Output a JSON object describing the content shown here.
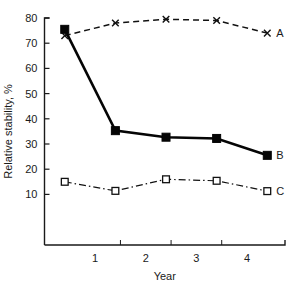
{
  "chart_data": {
    "type": "line",
    "title": "",
    "xlabel": "Year",
    "ylabel": "Relative stability, %",
    "xlim": [
      0,
      4.75
    ],
    "ylim": [
      5,
      81
    ],
    "grid": false,
    "legend_position": "right-inline",
    "x_ticks": [
      1.5,
      2.5,
      3.5
    ],
    "x_tick_labels": [
      "1",
      "2",
      "3",
      "4"
    ],
    "x_tick_label_values": [
      1,
      2,
      3,
      4
    ],
    "y_ticks": [
      10,
      20,
      30,
      40,
      50,
      60,
      70,
      80
    ],
    "y_tick_labels": [
      "10",
      "20",
      "30",
      "40",
      "50",
      "60",
      "70",
      "80"
    ],
    "x": [
      0.4,
      1.4,
      2.4,
      3.4,
      4.4
    ],
    "series": [
      {
        "name": "A",
        "label": "A",
        "marker": "cross-x",
        "linestyle": "dashed",
        "color": "#111111",
        "values": [
          73,
          78,
          79.5,
          79,
          74
        ]
      },
      {
        "name": "B",
        "label": "B",
        "marker": "filled-square",
        "linestyle": "solid",
        "color": "#050505",
        "values": [
          75.5,
          35.3,
          32.7,
          32.2,
          25.5
        ]
      },
      {
        "name": "C",
        "label": "C",
        "marker": "open-square",
        "linestyle": "dash-dot",
        "color": "#111111",
        "values": [
          15,
          11.4,
          16,
          15.4,
          11.3
        ]
      }
    ]
  },
  "axes": {
    "x_axis_name": "Year",
    "y_axis_name": "Relative stability, %"
  }
}
